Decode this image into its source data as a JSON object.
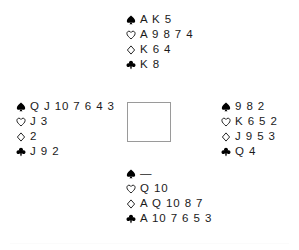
{
  "diagram": {
    "kind": "bridge-deal-diagram",
    "center_square": {
      "label": ""
    },
    "suit_symbols": {
      "spade": "spade-symbol",
      "heart": "heart-symbol",
      "diamond": "diamond-symbol",
      "club": "club-symbol"
    },
    "void_marker": "—",
    "hands": {
      "north": {
        "position": "North",
        "suits": [
          {
            "suit": "spade",
            "cards": "A K 5"
          },
          {
            "suit": "heart",
            "cards": "A 9 8 7 4"
          },
          {
            "suit": "diamond",
            "cards": "K 6 4"
          },
          {
            "suit": "club",
            "cards": "K 8"
          }
        ]
      },
      "west": {
        "position": "West",
        "suits": [
          {
            "suit": "spade",
            "cards": "Q J 10 7 6 4 3"
          },
          {
            "suit": "heart",
            "cards": "J 3"
          },
          {
            "suit": "diamond",
            "cards": "2"
          },
          {
            "suit": "club",
            "cards": "J 9 2"
          }
        ]
      },
      "east": {
        "position": "East",
        "suits": [
          {
            "suit": "spade",
            "cards": "9 8 2"
          },
          {
            "suit": "heart",
            "cards": "K 6 5 2"
          },
          {
            "suit": "diamond",
            "cards": "J 9 5 3"
          },
          {
            "suit": "club",
            "cards": "Q 4"
          }
        ]
      },
      "south": {
        "position": "South",
        "suits": [
          {
            "suit": "spade",
            "cards": "—"
          },
          {
            "suit": "heart",
            "cards": "Q 10"
          },
          {
            "suit": "diamond",
            "cards": "A Q 10 8 7"
          },
          {
            "suit": "club",
            "cards": "A 10 7 6 5 3"
          }
        ]
      }
    },
    "colors": {
      "ink": "#1a1a1a",
      "symbol": "#000000",
      "square_border": "#9a9a9a",
      "rule": "#fbfbfb",
      "background": "#ffffff"
    }
  }
}
